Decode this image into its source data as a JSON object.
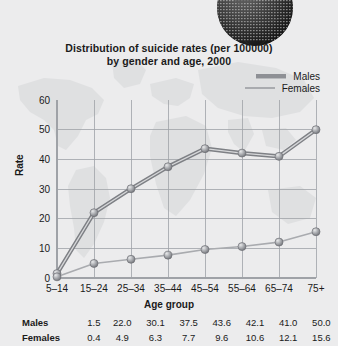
{
  "chart_data": {
    "type": "line",
    "title": "Distribution of suicide rates (per 100000) by gender and age, 2000",
    "title_line1": "Distribution of suicide rates (per 100000)",
    "title_line2": "by gender and age, 2000",
    "xlabel": "Age group",
    "ylabel": "Rate",
    "categories": [
      "5–14",
      "15–24",
      "25–34",
      "35–44",
      "45–54",
      "55–64",
      "65–74",
      "75+"
    ],
    "series": [
      {
        "name": "Males",
        "values": [
          1.5,
          22.0,
          30.1,
          37.5,
          43.6,
          42.1,
          41.0,
          50.0
        ]
      },
      {
        "name": "Females",
        "values": [
          0.4,
          4.9,
          6.3,
          7.7,
          9.6,
          10.6,
          12.1,
          15.6
        ]
      }
    ],
    "ylim": [
      0,
      60
    ],
    "yticks": [
      0,
      10,
      20,
      30,
      40,
      50,
      60
    ],
    "ytick_labels": [
      "0",
      "10",
      "20",
      "30",
      "40",
      "50",
      "60"
    ],
    "grid": "both",
    "legend_position": "top-right",
    "colors": {
      "males_line": "#8e9095",
      "females_line": "#a9abaf",
      "marker": "#9a9ca1",
      "grid": "#9fa2a7",
      "background": "#ececed",
      "text": "#1a1a1a"
    }
  },
  "legend": {
    "items": [
      {
        "label": "Males"
      },
      {
        "label": "Females"
      }
    ]
  },
  "table": {
    "rows": [
      {
        "label": "Males",
        "values": [
          "1.5",
          "22.0",
          "30.1",
          "37.5",
          "43.6",
          "42.1",
          "41.0",
          "50.0"
        ]
      },
      {
        "label": "Females",
        "values": [
          "0.4",
          "4.9",
          "6.3",
          "7.7",
          "9.6",
          "10.6",
          "12.1",
          "15.6"
        ]
      }
    ]
  },
  "globe": {
    "alt": "globe-graphic"
  }
}
